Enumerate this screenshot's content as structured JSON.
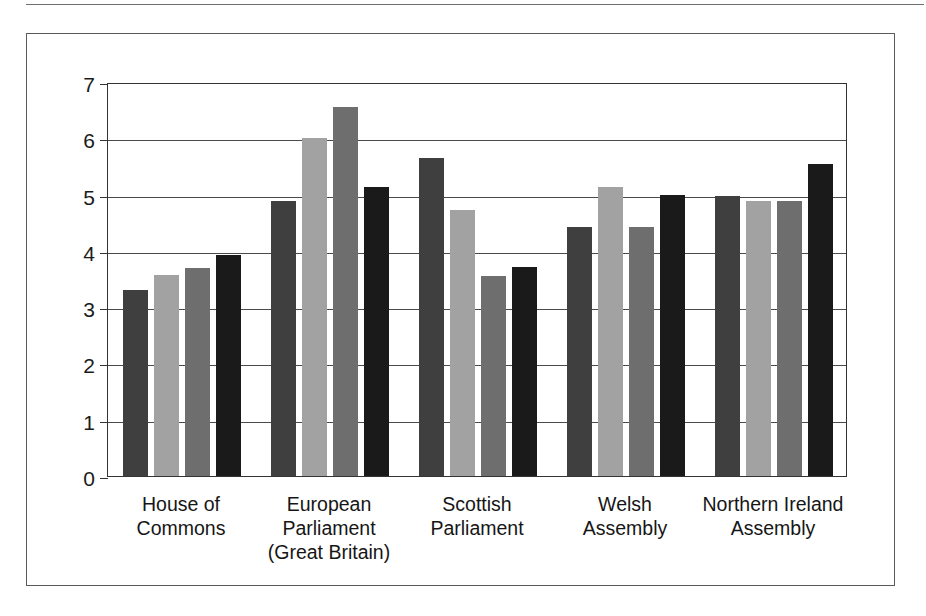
{
  "chart_data": {
    "type": "bar",
    "title": "",
    "subtitle": "",
    "xlabel": "",
    "ylabel": "",
    "ylim": [
      0,
      7
    ],
    "yticks": [
      "0",
      "1",
      "2",
      "3",
      "4",
      "5",
      "6",
      "7"
    ],
    "grid": true,
    "legend": "none",
    "categories": [
      "House of\nCommons",
      "European\nParliament\n(Great Britain)",
      "Scottish\nParliament",
      "Welsh\nAssembly",
      "Northern Ireland\nAssembly"
    ],
    "series": [
      {
        "name": "series-1",
        "color": "#3f3f3f",
        "values": [
          3.3,
          4.88,
          5.65,
          4.42,
          4.97
        ]
      },
      {
        "name": "series-2",
        "color": "#a2a2a2",
        "values": [
          3.58,
          6.0,
          4.73,
          5.13,
          4.88
        ]
      },
      {
        "name": "series-3",
        "color": "#6e6e6e",
        "values": [
          3.7,
          6.55,
          3.55,
          4.42,
          4.88
        ]
      },
      {
        "name": "series-4",
        "color": "#1a1a1a",
        "values": [
          3.93,
          5.13,
          3.72,
          5.0,
          5.55
        ]
      }
    ]
  },
  "colors": {
    "axis": "#333333",
    "grid": "#4a4a4a",
    "frame": "#5a5a5a",
    "text": "#161616",
    "background": "#ffffff"
  }
}
